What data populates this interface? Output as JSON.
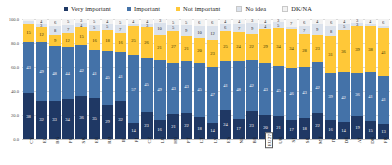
{
  "chart_data": {
    "type": "bar",
    "subtype": "stacked-percentage-column",
    "title": "",
    "xlabel": "",
    "ylabel": "",
    "ylim": [
      0,
      100
    ],
    "ytick_labels": [
      "100.0",
      "80.0",
      "60.0",
      "40.0",
      "20.0",
      "0.0"
    ],
    "yticks": [
      100,
      80,
      60,
      40,
      20,
      0
    ],
    "grid": true,
    "legend_position": "top-center",
    "categories": [
      "CY",
      "EL",
      "BG",
      "PL",
      "SK",
      "EE",
      "RO",
      "IE",
      "FI",
      "CZ",
      "LU",
      "HU",
      "PT",
      "LT",
      "LV",
      "ES",
      "NL",
      "BE",
      "EU27",
      "UK",
      "SI",
      "SE",
      "MT",
      "IT",
      "DE",
      "AT",
      "DK",
      "FR"
    ],
    "series": [
      {
        "name": "Very important",
        "color": "#1f3864",
        "values": [
          38,
          32,
          33,
          34,
          36,
          35,
          29,
          32,
          14,
          23,
          16,
          21,
          22,
          18,
          14,
          24,
          17,
          23,
          20,
          21,
          17,
          18,
          22,
          16,
          14,
          19,
          15,
          13
        ]
      },
      {
        "name": "Important",
        "color": "#4472a8",
        "values": [
          43,
          49,
          48,
          44,
          42,
          41,
          45,
          41,
          57,
          45,
          49,
          43,
          43,
          45,
          47,
          41,
          48,
          42,
          43,
          45,
          46,
          43,
          42,
          39,
          42,
          36,
          41,
          41
        ]
      },
      {
        "name": "Not important",
        "color": "#ffc838",
        "values": [
          15,
          12,
          9,
          12,
          15,
          16,
          18,
          16,
          25,
          26,
          21,
          27,
          21,
          20,
          23,
          25,
          24,
          22,
          29,
          34,
          34,
          28,
          23,
          31,
          36,
          39,
          38,
          41
        ]
      },
      {
        "name": "No idea",
        "color": "#dbe2ec",
        "values": [
          2,
          3,
          8,
          7,
          4,
          5,
          5,
          7,
          2,
          3,
          10,
          5,
          9,
          10,
          12,
          6,
          7,
          9,
          4,
          5,
          2,
          7,
          9,
          8,
          5,
          3,
          2,
          2
        ]
      },
      {
        "name": "DK/NA",
        "color": "#f2f2f2",
        "values": [
          2,
          4,
          6,
          5,
          3,
          5,
          4,
          5,
          4,
          4,
          3,
          5,
          5,
          6,
          6,
          4,
          4,
          3,
          4,
          3,
          7,
          6,
          4,
          6,
          4,
          3,
          4,
          6
        ]
      }
    ]
  },
  "legend": {
    "items": [
      {
        "label": "Very important",
        "color": "#1f3864"
      },
      {
        "label": "Important",
        "color": "#4472a8"
      },
      {
        "label": "Not important",
        "color": "#ffc838"
      },
      {
        "label": "No idea",
        "color": "#dbe2ec"
      },
      {
        "label": "DK/NA",
        "color": "#f2f2f2"
      }
    ]
  },
  "highlight": {
    "boxed_category": "EU27"
  }
}
